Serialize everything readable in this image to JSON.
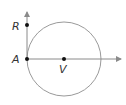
{
  "diagram": {
    "type": "geometry",
    "colors": {
      "circle": "#9a9a9a",
      "line": "#8a8a8a",
      "point": "#111111",
      "label": "#333333"
    },
    "points": [
      {
        "id": "R",
        "label": "R"
      },
      {
        "id": "A",
        "label": "A"
      },
      {
        "id": "V",
        "label": "V"
      }
    ],
    "elements": [
      {
        "kind": "circle",
        "center": "V",
        "through": "A"
      },
      {
        "kind": "ray",
        "from": "A",
        "through": "R"
      },
      {
        "kind": "ray",
        "from": "A",
        "through": "V"
      }
    ]
  }
}
